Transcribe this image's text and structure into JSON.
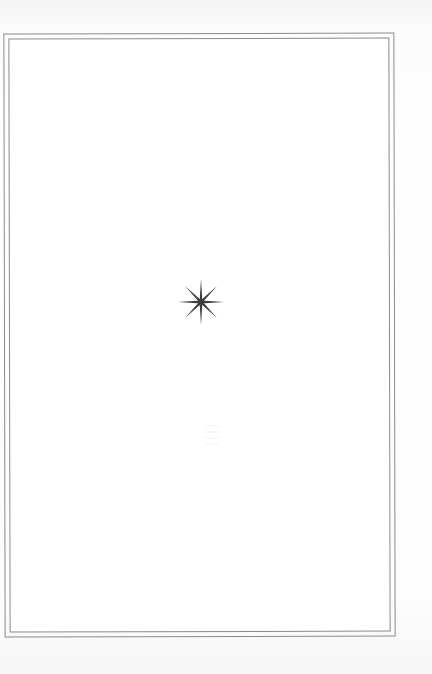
{
  "page": {
    "type": "book-page",
    "content": "blank decorative page",
    "background_color": "#ffffff",
    "border": {
      "style": "double-rule",
      "color": "#8a8a8a"
    },
    "ornament": {
      "icon": "eight-pointed-star-icon",
      "color": "#3d3d3d",
      "points": 8
    }
  }
}
